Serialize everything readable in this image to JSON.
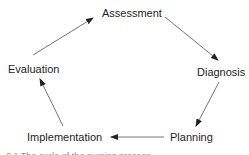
{
  "diagram": {
    "type": "cycle",
    "nodes": [
      {
        "id": "assessment",
        "label": "Assessment"
      },
      {
        "id": "diagnosis",
        "label": "Diagnosis"
      },
      {
        "id": "planning",
        "label": "Planning"
      },
      {
        "id": "implementation",
        "label": "Implementation"
      },
      {
        "id": "evaluation",
        "label": "Evaluation"
      }
    ],
    "edges": [
      {
        "from": "assessment",
        "to": "diagnosis"
      },
      {
        "from": "diagnosis",
        "to": "planning"
      },
      {
        "from": "planning",
        "to": "implementation"
      },
      {
        "from": "implementation",
        "to": "evaluation"
      },
      {
        "from": "evaluation",
        "to": "assessment"
      }
    ],
    "colors": {
      "text": "#1e1e1e",
      "arrow": "#555555",
      "background": "#ffffff"
    }
  },
  "caption": {
    "text": "2.1   The cycle of the nursing process"
  }
}
